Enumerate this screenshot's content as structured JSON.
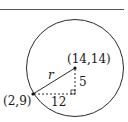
{
  "diagram": {
    "type": "geometry-circle-radius",
    "colors": {
      "stroke": "#2a2a2a",
      "topline": "#555555",
      "text": "#1a1a1a"
    },
    "labels": {
      "center_point": "(14,14)",
      "circle_point": "(2,9)",
      "radius": "r",
      "vertical_leg": "5",
      "horizontal_leg": "12"
    },
    "points": {
      "center": {
        "x": 14,
        "y": 14
      },
      "on_circle": {
        "x": 2,
        "y": 9
      }
    },
    "legs": {
      "vertical": 5,
      "horizontal": 12
    }
  }
}
